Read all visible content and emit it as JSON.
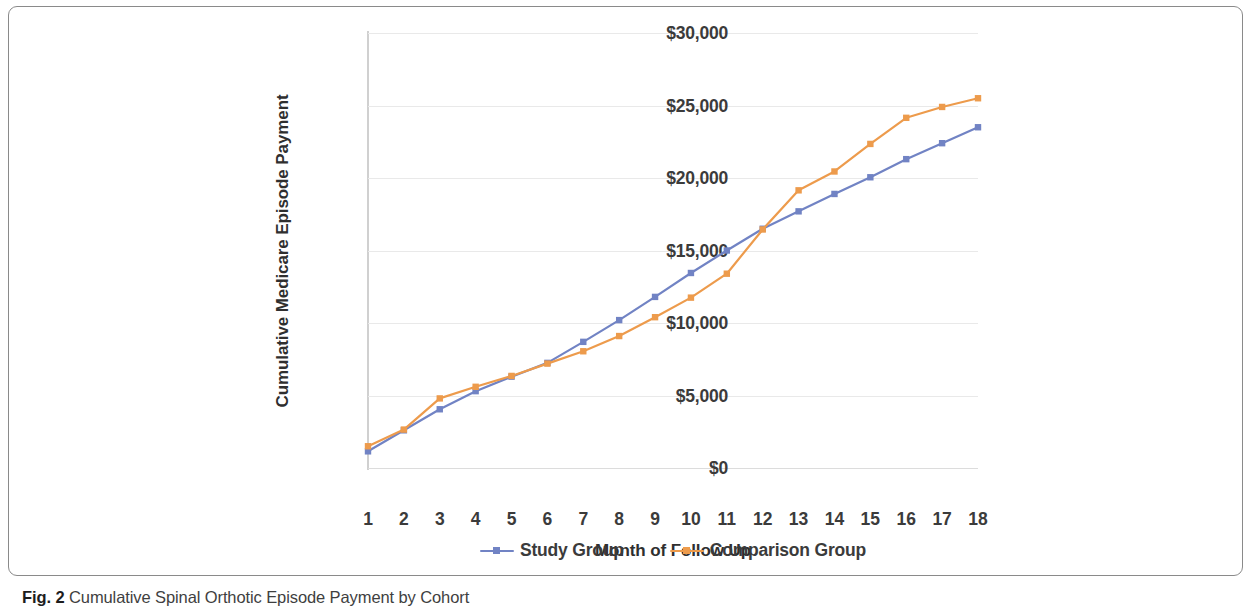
{
  "figure": {
    "caption_label": "Fig. 2",
    "caption_text": "Cumulative Spinal Orthotic Episode Payment by Cohort"
  },
  "colors": {
    "study_group": "#7183c4",
    "comparison_group": "#ed9b4c",
    "gridline": "#e9e9e9",
    "axis": "#d0d0d0",
    "tick_text": "#3b3b3b",
    "frame": "#8a8a8a"
  },
  "legend": {
    "position": "bottom-center",
    "items": [
      {
        "label": "Study Group",
        "color": "#7183c4"
      },
      {
        "label": "Comparison Group",
        "color": "#ed9b4c"
      }
    ]
  },
  "axes": {
    "y_title": "Cumulative Medicare Episode Payment",
    "x_title": "Month of Follow Up",
    "y_tick_labels": [
      "$30,000",
      "$25,000",
      "$20,000",
      "$15,000",
      "$10,000",
      "$5,000",
      "$0"
    ],
    "y_tick_values": [
      30000,
      25000,
      20000,
      15000,
      10000,
      5000,
      0
    ],
    "x_tick_labels": [
      "1",
      "2",
      "3",
      "4",
      "5",
      "6",
      "7",
      "8",
      "9",
      "10",
      "11",
      "12",
      "13",
      "14",
      "15",
      "16",
      "17",
      "18"
    ]
  },
  "chart_data": {
    "type": "line",
    "title": "Cumulative Spinal Orthotic Episode Payment by Cohort",
    "xlabel": "Month of Follow Up",
    "ylabel": "Cumulative Medicare Episode Payment",
    "x": [
      1,
      2,
      3,
      4,
      5,
      6,
      7,
      8,
      9,
      10,
      11,
      12,
      13,
      14,
      15,
      16,
      17,
      18
    ],
    "xlim": [
      1,
      18
    ],
    "ylim": [
      0,
      30000
    ],
    "y_ticks": [
      0,
      5000,
      10000,
      15000,
      20000,
      25000,
      30000
    ],
    "grid": true,
    "legend_position": "bottom-center",
    "series": [
      {
        "name": "Study Group",
        "color": "#7183c4",
        "marker": "square",
        "values": [
          1150,
          2600,
          4050,
          5300,
          6300,
          7250,
          8700,
          10200,
          11800,
          13450,
          15000,
          16500,
          17700,
          18900,
          20050,
          21300,
          22400,
          23500
        ]
      },
      {
        "name": "Comparison Group",
        "color": "#ed9b4c",
        "marker": "square",
        "values": [
          1500,
          2650,
          4800,
          5600,
          6350,
          7200,
          8050,
          9100,
          10400,
          11750,
          13400,
          16450,
          19150,
          20450,
          22350,
          24150,
          24900,
          25500
        ]
      }
    ]
  }
}
